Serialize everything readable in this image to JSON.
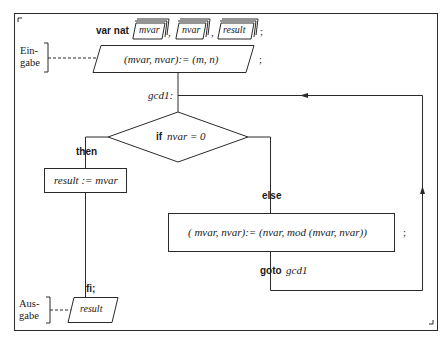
{
  "diagram": {
    "declaration": {
      "keyword": "var nat",
      "variables": [
        "mvar",
        "nvar",
        "result"
      ],
      "separators": [
        ",",
        ","
      ],
      "terminator": ";"
    },
    "input": {
      "side_label_line1": "Ein-",
      "side_label_line2": "gabe",
      "statement": "(mvar, nvar):= (m, n)",
      "terminator": ";"
    },
    "label": "gcd1:",
    "decision": {
      "condition_keyword": "if",
      "condition_expr": "nvar = 0"
    },
    "then_branch": {
      "keyword": "then",
      "statement": "result := mvar",
      "end_keyword": "fi;"
    },
    "else_branch": {
      "keyword": "else",
      "statement": "( mvar, nvar):= (nvar, mod (mvar, nvar))",
      "terminator": ";",
      "goto_keyword": "goto",
      "goto_target": "gcd1"
    },
    "output": {
      "side_label_line1": "Aus-",
      "side_label_line2": "gabe",
      "value": "result"
    }
  },
  "colors": {
    "stroke": "#2a2a2a",
    "background": "#ffffff",
    "text": "#1a1a1a"
  }
}
